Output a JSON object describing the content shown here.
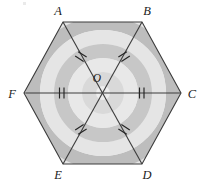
{
  "figure": {
    "shape": "hexagon",
    "center_label": "O",
    "width": 205,
    "height": 186,
    "colors": {
      "outline": "#3c3c3c",
      "label": "#1b1b1b",
      "fill_light": "#e7e7e7",
      "band_light": "#dcdcdc",
      "band_mid": "#c9c9c9",
      "band_dark": "#a9a9a9",
      "background": "#ffffff",
      "tick": "#242424"
    },
    "vertices": [
      {
        "label": "A",
        "x": 63,
        "y": 22,
        "label_x": 58,
        "label_y": 12
      },
      {
        "label": "B",
        "x": 142,
        "y": 22,
        "label_x": 145,
        "label_y": 12
      },
      {
        "label": "C",
        "x": 181,
        "y": 93,
        "label_x": 186,
        "label_y": 97
      },
      {
        "label": "D",
        "x": 142,
        "y": 164,
        "label_x": 145,
        "label_y": 177
      },
      {
        "label": "E",
        "x": 63,
        "y": 164,
        "label_x": 58,
        "label_y": 177
      },
      {
        "label": "F",
        "x": 24,
        "y": 93,
        "label_x": 12,
        "label_y": 97
      }
    ],
    "center": {
      "label": "O",
      "x": 102.5,
      "y": 93,
      "label_x": 97,
      "label_y": 80
    },
    "diagonals": [
      {
        "name": "AD",
        "from": "A",
        "to": "D"
      },
      {
        "name": "BE",
        "from": "B",
        "to": "E"
      },
      {
        "name": "CF",
        "from": "C",
        "to": "F"
      }
    ],
    "radii": [
      {
        "name": "OA",
        "ticks": 2
      },
      {
        "name": "OB",
        "ticks": 2
      },
      {
        "name": "OC",
        "ticks": 2
      },
      {
        "name": "OD",
        "ticks": 2
      },
      {
        "name": "OE",
        "ticks": 2
      },
      {
        "name": "OF",
        "ticks": 2
      }
    ],
    "tick_marks": [
      {
        "on": "OA",
        "count": 2,
        "x": 80,
        "y": 59
      },
      {
        "on": "OB",
        "count": 2,
        "x": 125,
        "y": 59
      },
      {
        "on": "OC",
        "count": 2,
        "x": 142,
        "y": 93
      },
      {
        "on": "OD",
        "count": 2,
        "x": 125,
        "y": 128
      },
      {
        "on": "OE",
        "count": 2,
        "x": 80,
        "y": 128
      },
      {
        "on": "OF",
        "count": 2,
        "x": 62,
        "y": 93
      }
    ],
    "decoration": {
      "name": "concentric-arc-bands",
      "description": "Alternating light and mid gray concentric circular bands centered near the hexagon center, clipped to the hexagon.",
      "band_radii": [
        16,
        29,
        42,
        55,
        68,
        81,
        94,
        107,
        120
      ]
    }
  }
}
